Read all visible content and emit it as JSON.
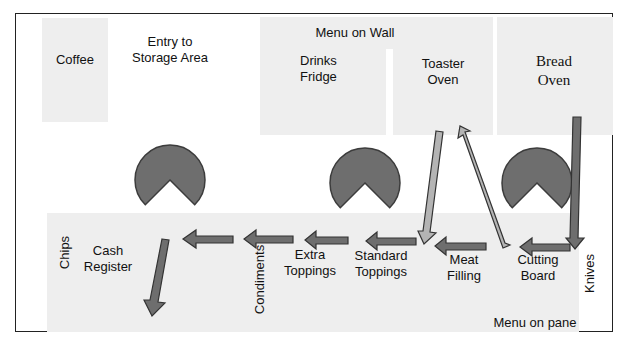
{
  "diagram": {
    "stations_top": [
      {
        "id": "coffee",
        "label": "Coffee"
      },
      {
        "id": "storage",
        "label_line1": "Entry to",
        "label_line2": "Storage Area"
      },
      {
        "id": "menu_wall",
        "label": "Menu on Wall"
      },
      {
        "id": "drinks",
        "label_line1": "Drinks",
        "label_line2": "Fridge"
      },
      {
        "id": "toaster",
        "label_line1": "Toaster",
        "label_line2": "Oven"
      },
      {
        "id": "bread",
        "label_line1": "Bread",
        "label_line2": "Oven"
      }
    ],
    "stations_counter": [
      {
        "id": "chips",
        "label": "Chips"
      },
      {
        "id": "cash",
        "label_line1": "Cash",
        "label_line2": "Register"
      },
      {
        "id": "condiments",
        "label": "Condiments"
      },
      {
        "id": "extra",
        "label_line1": "Extra",
        "label_line2": "Toppings"
      },
      {
        "id": "standard",
        "label_line1": "Standard",
        "label_line2": "Toppings"
      },
      {
        "id": "meat",
        "label_line1": "Meat",
        "label_line2": "Filling"
      },
      {
        "id": "cutting",
        "label_line1": "Cutting",
        "label_line2": "Board"
      },
      {
        "id": "knives",
        "label": "Knives"
      },
      {
        "id": "menu_pane",
        "label": "Menu on pane"
      }
    ],
    "colors": {
      "zone_fill": "#eeeeee",
      "worker_fill": "#6e6e6e",
      "worker_stroke": "#3c3c3c",
      "arrow_dark": "#6e6e6e",
      "arrow_light": "#b4b4b4",
      "arrow_stroke": "#333333",
      "border": "#222222"
    }
  }
}
